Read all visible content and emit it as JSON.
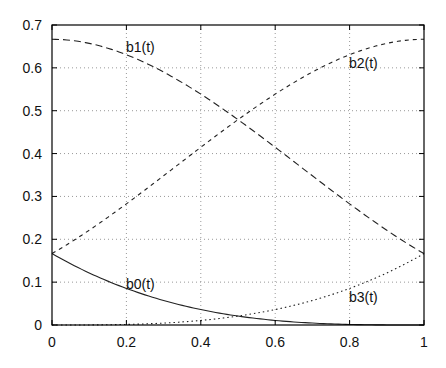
{
  "chart_data": {
    "type": "line",
    "title": "",
    "xlabel": "",
    "ylabel": "",
    "xlim": [
      0,
      1
    ],
    "ylim": [
      0,
      0.7
    ],
    "grid": true,
    "legend": "inline labels",
    "x_ticks": [
      "0",
      "0.2",
      "0.4",
      "0.6",
      "0.8",
      "1"
    ],
    "y_ticks": [
      "0",
      "0.1",
      "0.2",
      "0.3",
      "0.4",
      "0.5",
      "0.6",
      "0.7"
    ],
    "x": [
      0,
      0.1,
      0.2,
      0.3,
      0.4,
      0.5,
      0.6,
      0.7,
      0.8,
      0.9,
      1.0
    ],
    "series": [
      {
        "name": "b0(t)",
        "style": "solid",
        "values": [
          0.1667,
          0.1215,
          0.0853,
          0.0572,
          0.036,
          0.0208,
          0.0107,
          0.0045,
          0.0013,
          0.0002,
          0
        ]
      },
      {
        "name": "b1(t)",
        "style": "long-dash",
        "values": [
          0.6667,
          0.6522,
          0.6107,
          0.5485,
          0.4747,
          0.3958,
          0.3173,
          0.2448,
          0.1787,
          0.1215,
          0.1667
        ]
      },
      {
        "name": "b2(t)",
        "style": "short-dash",
        "values": [
          0.1667,
          0.2215,
          0.2853,
          0.3572,
          0.4347,
          0.5208,
          0.5973,
          0.6225,
          0.6453,
          0.6602,
          0.6667
        ]
      },
      {
        "name": "b3(t)",
        "style": "dotted",
        "values": [
          0,
          0.0002,
          0.0013,
          0.0045,
          0.0107,
          0.0208,
          0.036,
          0.0572,
          0.0853,
          0.1215,
          0.1667
        ]
      }
    ],
    "annotations": [
      {
        "text": "b0(t)",
        "x": 0.2,
        "y": 0.095
      },
      {
        "text": "b1(t)",
        "x": 0.2,
        "y": 0.64
      },
      {
        "text": "b2(t)",
        "x": 0.8,
        "y": 0.6
      },
      {
        "text": "b3(t)",
        "x": 0.8,
        "y": 0.05
      }
    ]
  },
  "labels": {
    "b0": "b0(t)",
    "b1": "b1(t)",
    "b2": "b2(t)",
    "b3": "b3(t)"
  },
  "axis": {
    "x": [
      "0",
      "0.2",
      "0.4",
      "0.6",
      "0.8",
      "1"
    ],
    "y": [
      "0",
      "0.1",
      "0.2",
      "0.3",
      "0.4",
      "0.5",
      "0.6",
      "0.7"
    ]
  },
  "colors": {
    "line": "#222222",
    "grid": "#888888",
    "axis": "#000000"
  }
}
